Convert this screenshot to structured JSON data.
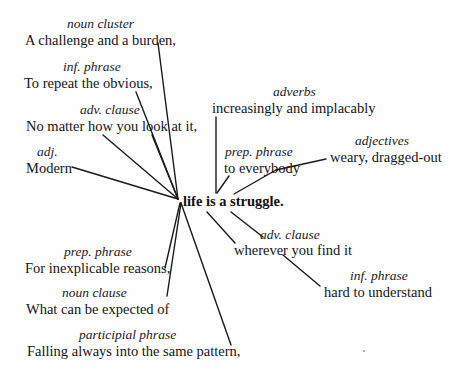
{
  "diagram": {
    "core_sentence": "life is a struggle.",
    "modifiers": [
      {
        "id": "noun-cluster",
        "label": "noun cluster",
        "phrase": "A challenge and a burden,"
      },
      {
        "id": "inf-phrase-1",
        "label": "inf. phrase",
        "phrase": "To repeat the obvious,"
      },
      {
        "id": "adv-clause-1",
        "label": "adv. clause",
        "phrase": "No matter how you look at it,"
      },
      {
        "id": "adj",
        "label": "adj.",
        "phrase": "Modern"
      },
      {
        "id": "prep-phrase-1",
        "label": "prep. phrase",
        "phrase": "For inexplicable reasons,"
      },
      {
        "id": "noun-clause",
        "label": "noun clause",
        "phrase": "What can be expected of"
      },
      {
        "id": "participial-phrase",
        "label": "participial phrase",
        "phrase": "Falling always into the same pattern,"
      },
      {
        "id": "adverbs",
        "label": "adverbs",
        "phrase": "increasingly and implacably"
      },
      {
        "id": "adjectives",
        "label": "adjectives",
        "phrase": "weary, dragged-out"
      },
      {
        "id": "prep-phrase-2",
        "label": "prep. phrase",
        "phrase": "to everybody"
      },
      {
        "id": "adv-clause-2",
        "label": "adv. clause",
        "phrase": "wherever you find it"
      },
      {
        "id": "inf-phrase-2",
        "label": "inf. phrase",
        "phrase": "hard to understand"
      }
    ]
  }
}
